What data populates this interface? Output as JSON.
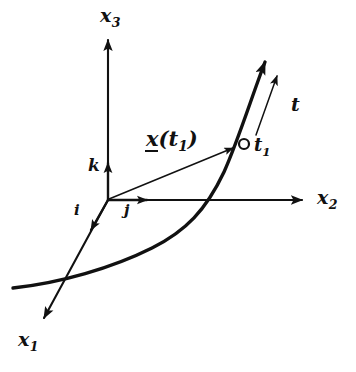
{
  "figure": {
    "background_color": "#ffffff",
    "ink_color": "#111111",
    "axes": [
      {
        "name": "x1",
        "label_base": "x",
        "label_sub": "1",
        "direction": "down-left"
      },
      {
        "name": "x2",
        "label_base": "x",
        "label_sub": "2",
        "direction": "right"
      },
      {
        "name": "x3",
        "label_base": "x",
        "label_sub": "3",
        "direction": "up"
      }
    ],
    "unit_vectors": [
      {
        "name": "i",
        "label": "i",
        "along_axis": "x1"
      },
      {
        "name": "j",
        "label": "j",
        "along_axis": "x2"
      },
      {
        "name": "k",
        "label": "k",
        "along_axis": "x3"
      }
    ],
    "position_vector": {
      "label_prefix": "x",
      "label_suffix": "(t",
      "label_sub": "1",
      "label_close": ")",
      "underlined": "true"
    },
    "point": {
      "label_base": "t",
      "label_sub": "1",
      "marker": "open-circle"
    },
    "tangent_vector": {
      "label": "t"
    }
  }
}
